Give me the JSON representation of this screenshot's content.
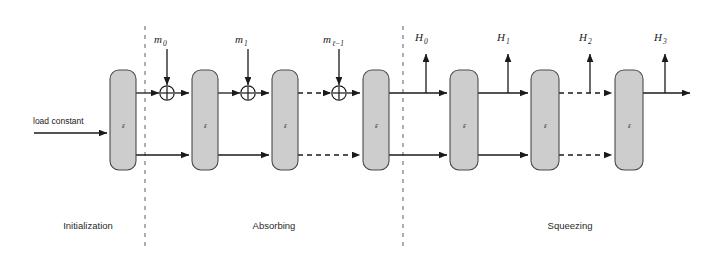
{
  "diagram": {
    "permutation_label": "ᵋ",
    "input_label": "load constant",
    "colors": {
      "box_fill": "#cdcdcd",
      "box_stroke": "#4a4a4a",
      "wire": "#1a1a1a",
      "separator": "#7a7a7a",
      "background": "#ffffff"
    },
    "phases": [
      {
        "name": "Initialization",
        "label": "Initialization",
        "x": 88
      },
      {
        "name": "Absorbing",
        "label": "Absorbing",
        "x": 274
      },
      {
        "name": "Squeezing",
        "label": "Squeezing",
        "x": 570
      }
    ],
    "separators": [
      {
        "name": "init-absorb-divider",
        "x": 145
      },
      {
        "name": "absorb-squeeze-divider",
        "x": 403
      }
    ],
    "permutation_boxes": [
      {
        "id": "p1",
        "phase": "Initialization",
        "label": "ᵋ",
        "x": 110
      },
      {
        "id": "p2",
        "phase": "Absorbing",
        "label": "ᵋ",
        "x": 192
      },
      {
        "id": "p3",
        "phase": "Absorbing",
        "label": "ᵋ",
        "x": 272
      },
      {
        "id": "p4",
        "phase": "Absorbing",
        "label": "ᵋ",
        "x": 363
      },
      {
        "id": "p5",
        "phase": "Squeezing",
        "label": "ᵋ",
        "x": 450
      },
      {
        "id": "p6",
        "phase": "Squeezing",
        "label": "ᵋ",
        "x": 531
      },
      {
        "id": "p7",
        "phase": "Squeezing",
        "label": "ᵋ",
        "x": 615
      }
    ],
    "message_inputs": [
      {
        "id": "m0",
        "base": "m",
        "sub": "0",
        "x": 167
      },
      {
        "id": "m1",
        "base": "m",
        "sub": "1",
        "x": 248
      },
      {
        "id": "m_l_minus_1",
        "base": "m",
        "sub": "ℓ−1",
        "x": 339
      }
    ],
    "hash_outputs": [
      {
        "id": "H0",
        "base": "H",
        "sub": "0",
        "x": 426
      },
      {
        "id": "H1",
        "base": "H",
        "sub": "1",
        "x": 508
      },
      {
        "id": "H2",
        "base": "H",
        "sub": "2",
        "x": 590
      },
      {
        "id": "H3",
        "base": "H",
        "sub": "3",
        "x": 665
      }
    ],
    "xor_gates": [
      {
        "id": "xor-m0",
        "x": 167
      },
      {
        "id": "xor-m1",
        "x": 248
      },
      {
        "id": "xor-ml",
        "x": 339
      }
    ],
    "rails": {
      "top_y": 93,
      "bottom_y": 155,
      "input_y": 127
    }
  }
}
